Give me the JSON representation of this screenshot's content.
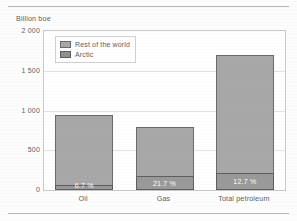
{
  "axis_title": "Billion boe",
  "legend": {
    "items": [
      {
        "label": "Rest of the world",
        "swatch": "light-gray-swatch"
      },
      {
        "label": "Arctic",
        "swatch": "dark-gray-swatch"
      }
    ]
  },
  "yaxis": {
    "ticks": [
      "2 000",
      "1 500",
      "1 000",
      "500",
      "0"
    ],
    "tick_values": [
      2000,
      1500,
      1000,
      500,
      0
    ]
  },
  "colors": {
    "rest_of_world": "#a8a8a8",
    "arctic": "#9a9a9a",
    "bar_outline": "#5e5e5e",
    "gridline": "#e2e2e2",
    "frame": "#c9c9c9",
    "text": "#5d5d5d",
    "label_text": "#ffffff",
    "page": "#fdfdfd"
  },
  "chart_data": {
    "type": "bar",
    "subtype": "stacked",
    "title": "",
    "subtitle": "",
    "xlabel": "",
    "ylabel": "Billion boe",
    "ylim": [
      0,
      2000
    ],
    "yticks": [
      0,
      500,
      1000,
      1500,
      2000
    ],
    "ytick_labels": [
      "0",
      "500",
      "1 000",
      "1 500",
      "2 000"
    ],
    "grid": true,
    "legend_position": "upper-left-inside",
    "categories": [
      "Oil",
      "Gas",
      "Total petroleum"
    ],
    "series": [
      {
        "name": "Arctic",
        "values": [
          63,
          175,
          215
        ]
      },
      {
        "name": "Rest of the world",
        "values": [
          877,
          615,
          1485
        ]
      }
    ],
    "totals": [
      940,
      790,
      1700
    ],
    "annotations": [
      {
        "category": "Oil",
        "text": "6.7 %",
        "series": "Arctic"
      },
      {
        "category": "Gas",
        "text": "21.7 %",
        "series": "Arctic"
      },
      {
        "category": "Total petroleum",
        "text": "12.7 %",
        "series": "Arctic"
      }
    ]
  }
}
